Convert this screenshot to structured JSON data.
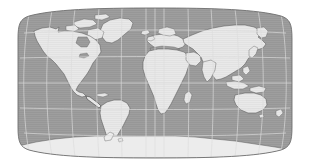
{
  "figure": {
    "kind": "world-map",
    "title": "World Map",
    "alt_text": "Grayscale world map in a Robinson-style pseudocylindrical projection",
    "width": 310,
    "height": 166
  },
  "map": {
    "projection": "robinson",
    "projection_label": "Robinson pseudocylindrical",
    "center_longitude": 0,
    "center_latitude": 0,
    "frame": {
      "left": 18,
      "top": 8,
      "right": 292,
      "bottom": 158,
      "outline_color": "#6f6f6f",
      "outline_width": 0.8
    },
    "colors": {
      "background": "#ffffff",
      "ocean": "#9e9e9e",
      "ocean_shade": "#949494",
      "land": "#e6e6e6",
      "land_highlight": "#efefef",
      "coastline": "#5a5a5a",
      "graticule": "#dcdcdc",
      "frame_outline": "#6f6f6f",
      "antarctica": "#ececec"
    },
    "graticule": {
      "visible": true,
      "parallel_interval_deg": 30,
      "meridian_interval_deg": 30,
      "parallels_deg": [
        -60,
        -30,
        0,
        30,
        60
      ],
      "meridians_deg": [
        -180,
        -150,
        -120,
        -90,
        -60,
        -30,
        0,
        30,
        60,
        90,
        120,
        150,
        180
      ],
      "line_color": "#dcdcdc",
      "line_width": 0.7,
      "equator_emphasized": false
    },
    "labels": {
      "visible": false,
      "tick_labels": [],
      "country_labels": [],
      "legend_entries": []
    },
    "continents": [
      {
        "name": "North America",
        "fill": "land"
      },
      {
        "name": "Greenland",
        "fill": "land"
      },
      {
        "name": "Central America",
        "fill": "land"
      },
      {
        "name": "South America",
        "fill": "land"
      },
      {
        "name": "Europe",
        "fill": "land"
      },
      {
        "name": "Africa",
        "fill": "land"
      },
      {
        "name": "Asia",
        "fill": "land"
      },
      {
        "name": "Indonesia",
        "fill": "land"
      },
      {
        "name": "Australia",
        "fill": "land"
      },
      {
        "name": "New Zealand",
        "fill": "land"
      },
      {
        "name": "Antarctica",
        "fill": "antarctica"
      },
      {
        "name": "Madagascar",
        "fill": "land"
      },
      {
        "name": "Japan",
        "fill": "land"
      },
      {
        "name": "British Isles",
        "fill": "land"
      }
    ],
    "oceans": [
      {
        "name": "Pacific Ocean"
      },
      {
        "name": "Atlantic Ocean"
      },
      {
        "name": "Indian Ocean"
      },
      {
        "name": "Arctic Ocean"
      },
      {
        "name": "Southern Ocean"
      }
    ]
  }
}
